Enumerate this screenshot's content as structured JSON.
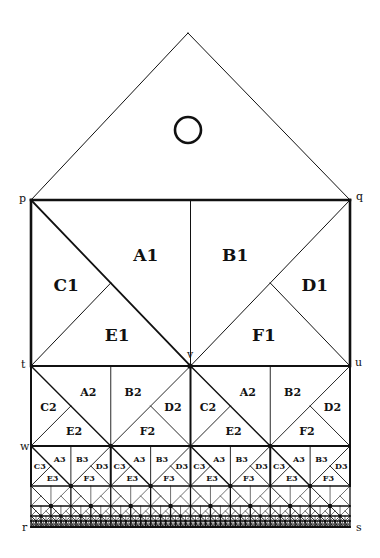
{
  "figure": {
    "background": "#ffffff",
    "ink": "#111111",
    "apex": {
      "x": 188,
      "y": 33
    },
    "circle": {
      "cx": 188,
      "cy": 130,
      "r": 13
    },
    "points": {
      "p": {
        "label": "p",
        "x": 31,
        "y": 200
      },
      "q": {
        "label": "q",
        "x": 350,
        "y": 200
      },
      "t": {
        "label": "t",
        "x": 33,
        "y": 366
      },
      "u": {
        "label": "u",
        "x": 350,
        "y": 366
      },
      "v": {
        "label": "v",
        "x": 190,
        "y": 366
      },
      "w": {
        "label": "w",
        "x": 33,
        "y": 446
      },
      "r": {
        "label": "r",
        "x": 33,
        "y": 527
      },
      "s": {
        "label": "s",
        "x": 350,
        "y": 527
      }
    },
    "levels": [
      {
        "level": 1,
        "y_top": 200,
        "y_bot": 366,
        "cells": 1,
        "labels": [
          "A1",
          "B1",
          "C1",
          "D1",
          "E1",
          "F1"
        ]
      },
      {
        "level": 2,
        "y_top": 366,
        "y_bot": 446,
        "cells": 2,
        "labels": [
          "A2",
          "B2",
          "C2",
          "D2",
          "E2",
          "F2"
        ]
      },
      {
        "level": 3,
        "y_top": 446,
        "y_bot": 486,
        "cells": 4,
        "labels": [
          "A3",
          "B3",
          "C3",
          "D3",
          "E3",
          "F3"
        ]
      },
      {
        "level": 4,
        "y_top": 486,
        "y_bot": 506,
        "cells": 8,
        "labels": []
      },
      {
        "level": 5,
        "y_top": 506,
        "y_bot": 516,
        "cells": 16,
        "labels": []
      },
      {
        "level": 6,
        "y_top": 516,
        "y_bot": 521,
        "cells": 32,
        "labels": []
      },
      {
        "level": 7,
        "y_top": 521,
        "y_bot": 527,
        "cells": 64,
        "labels": []
      }
    ],
    "label_sizes": {
      "1": 17,
      "2": 11,
      "3": 8
    }
  }
}
